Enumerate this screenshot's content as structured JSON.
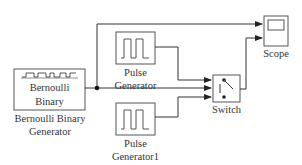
{
  "diagram": {
    "type": "simulink-model",
    "blocks": [
      {
        "id": "bernoulli",
        "name": "Bernoulli Binary Generator",
        "label_line1": "Bernoulli Binary",
        "label_line2": "Generator",
        "inner_line1": "Bernoulli",
        "inner_line2": "Binary",
        "icon": "bernoulli-waveform-icon"
      },
      {
        "id": "pulse1",
        "name": "Pulse Generator",
        "label_line1": "Pulse",
        "label_line2": "Generator",
        "icon": "square-pulse-icon"
      },
      {
        "id": "pulse2",
        "name": "Pulse Generator1",
        "label_line1": "Pulse",
        "label_line2": "Generator1",
        "icon": "square-pulse-icon"
      },
      {
        "id": "switch",
        "name": "Switch",
        "label": "Switch",
        "icon": "switch-icon"
      },
      {
        "id": "scope",
        "name": "Scope",
        "label": "Scope",
        "icon": "scope-screen-icon"
      }
    ],
    "connections": [
      {
        "from": "bernoulli",
        "to": "switch",
        "port": 2
      },
      {
        "from": "bernoulli",
        "to": "scope",
        "port": 1,
        "via": "branch"
      },
      {
        "from": "pulse1",
        "to": "switch",
        "port": 1
      },
      {
        "from": "pulse2",
        "to": "switch",
        "port": 3
      },
      {
        "from": "switch",
        "to": "scope",
        "port": 2
      }
    ],
    "colors": {
      "line": "#333333",
      "block_border": "#555555",
      "background": "#ffffff"
    }
  }
}
